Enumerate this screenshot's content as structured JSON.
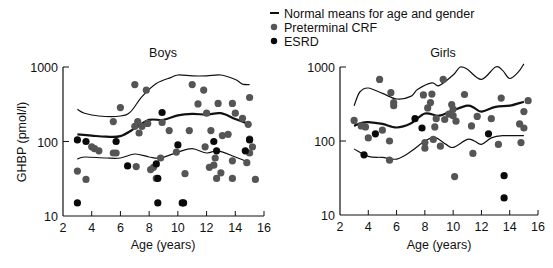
{
  "legend": {
    "items": [
      {
        "label": "Normal means for age and gender",
        "marker": "line"
      },
      {
        "label": "Preterminal CRF",
        "marker": "dot",
        "color": "#555555"
      },
      {
        "label": "ESRD",
        "marker": "dot",
        "color": "#0a0a0a"
      }
    ]
  },
  "chart_data": [
    {
      "type": "scatter",
      "title": "Boys",
      "xlabel": "Age (years)",
      "ylabel": "GHBP (pmol/l)",
      "xlim": [
        2,
        16
      ],
      "ylim": [
        10,
        1000
      ],
      "yscale": "log",
      "xticks": [
        2,
        4,
        6,
        8,
        10,
        12,
        14,
        16
      ],
      "yticks": [
        10,
        100,
        1000
      ],
      "grid": false,
      "series": [
        {
          "name": "Normal mean",
          "kind": "line",
          "width": 2.2,
          "points": [
            [
              3,
              125
            ],
            [
              4,
              120
            ],
            [
              5,
              116
            ],
            [
              6,
              118
            ],
            [
              7,
              150
            ],
            [
              8,
              195
            ],
            [
              9,
              195
            ],
            [
              10,
              225
            ],
            [
              11,
              235
            ],
            [
              12,
              230
            ],
            [
              13,
              240
            ],
            [
              14,
              200
            ],
            [
              15,
              170
            ]
          ]
        },
        {
          "name": "Upper normal",
          "kind": "line",
          "width": 1.2,
          "points": [
            [
              3,
              270
            ],
            [
              3.5,
              240
            ],
            [
              4.5,
              220
            ],
            [
              6,
              220
            ],
            [
              6.7,
              250
            ],
            [
              7.5,
              400
            ],
            [
              8.5,
              600
            ],
            [
              9.5,
              720
            ],
            [
              10,
              780
            ],
            [
              11,
              760
            ],
            [
              12,
              760
            ],
            [
              13,
              780
            ],
            [
              14,
              680
            ],
            [
              14.5,
              590
            ],
            [
              15,
              580
            ]
          ]
        },
        {
          "name": "Lower normal",
          "kind": "line",
          "width": 1.2,
          "points": [
            [
              3,
              58
            ],
            [
              3.5,
              62
            ],
            [
              5,
              60
            ],
            [
              6,
              60
            ],
            [
              7,
              68
            ],
            [
              8,
              62
            ],
            [
              8.8,
              60
            ],
            [
              10,
              72
            ],
            [
              11,
              80
            ],
            [
              12,
              70
            ],
            [
              12.8,
              75
            ],
            [
              14,
              62
            ],
            [
              15,
              52
            ]
          ]
        },
        {
          "name": "Preterminal CRF",
          "kind": "dots",
          "color": "#555555",
          "points": [
            [
              3,
              40
            ],
            [
              3.6,
              31
            ],
            [
              4,
              85
            ],
            [
              4.2,
              80
            ],
            [
              4.5,
              75
            ],
            [
              5.5,
              185
            ],
            [
              5.5,
              70
            ],
            [
              5.7,
              70
            ],
            [
              6,
              285
            ],
            [
              7,
              580
            ],
            [
              7,
              160
            ],
            [
              7.1,
              46
            ],
            [
              7.2,
              185
            ],
            [
              7.3,
              130
            ],
            [
              7.5,
              160
            ],
            [
              7.8,
              490
            ],
            [
              7.9,
              175
            ],
            [
              8.1,
              42
            ],
            [
              8.3,
              45
            ],
            [
              8.5,
              32
            ],
            [
              8.8,
              60
            ],
            [
              8.9,
              180
            ],
            [
              9.4,
              140
            ],
            [
              9.9,
              72
            ],
            [
              10.5,
              37
            ],
            [
              10.8,
              140
            ],
            [
              11,
              580
            ],
            [
              11.4,
              320
            ],
            [
              11.8,
              490
            ],
            [
              11.9,
              85
            ],
            [
              12,
              240
            ],
            [
              12.2,
              45
            ],
            [
              12.3,
              140
            ],
            [
              12.5,
              48
            ],
            [
              12.6,
              60
            ],
            [
              12.7,
              32
            ],
            [
              12.8,
              325
            ],
            [
              13,
              38
            ],
            [
              13.1,
              120
            ],
            [
              13.5,
              125
            ],
            [
              13.8,
              325
            ],
            [
              13.8,
              32
            ],
            [
              13.8,
              55
            ],
            [
              14,
              240
            ],
            [
              14.5,
              205
            ],
            [
              14.8,
              52
            ],
            [
              14.9,
              170
            ],
            [
              15,
              390
            ],
            [
              15,
              108
            ],
            [
              15,
              70
            ],
            [
              15.2,
              85
            ],
            [
              15.4,
              31
            ]
          ]
        },
        {
          "name": "ESRD",
          "kind": "dots",
          "color": "#0a0a0a",
          "points": [
            [
              3,
              105
            ],
            [
              3,
              15
            ],
            [
              3.6,
              100
            ],
            [
              5.7,
              100
            ],
            [
              6.5,
              47
            ],
            [
              8.5,
              50
            ],
            [
              8.6,
              32
            ],
            [
              8.6,
              15
            ],
            [
              8.9,
              245
            ],
            [
              10,
              90
            ],
            [
              10.3,
              15
            ],
            [
              10.4,
              15
            ],
            [
              12.5,
              100
            ],
            [
              12.7,
              75
            ],
            [
              14.7,
              75
            ],
            [
              15,
              105
            ]
          ]
        }
      ]
    },
    {
      "type": "scatter",
      "title": "Girls",
      "xlabel": "Age (years)",
      "ylabel": "",
      "xlim": [
        2,
        16
      ],
      "ylim": [
        10,
        1000
      ],
      "yscale": "log",
      "xticks": [
        2,
        4,
        6,
        8,
        10,
        12,
        14,
        16
      ],
      "yticks": [
        10,
        100,
        1000
      ],
      "grid": false,
      "series": [
        {
          "name": "Normal mean",
          "kind": "line",
          "width": 2.2,
          "points": [
            [
              3,
              160
            ],
            [
              3.5,
              175
            ],
            [
              4,
              180
            ],
            [
              5,
              170
            ],
            [
              6,
              152
            ],
            [
              7,
              172
            ],
            [
              8,
              235
            ],
            [
              9,
              220
            ],
            [
              10,
              260
            ],
            [
              11,
              300
            ],
            [
              11.5,
              280
            ],
            [
              12,
              250
            ],
            [
              13,
              290
            ],
            [
              14,
              300
            ],
            [
              15,
              340
            ]
          ]
        },
        {
          "name": "Upper normal",
          "kind": "line",
          "width": 1.2,
          "points": [
            [
              3,
              300
            ],
            [
              3.4,
              460
            ],
            [
              4,
              520
            ],
            [
              5,
              440
            ],
            [
              6,
              370
            ],
            [
              7,
              400
            ],
            [
              7.5,
              500
            ],
            [
              8.5,
              610
            ],
            [
              9,
              560
            ],
            [
              10,
              780
            ],
            [
              10.5,
              1000
            ],
            [
              11,
              930
            ],
            [
              12,
              680
            ],
            [
              13,
              1000
            ],
            [
              13.5,
              900
            ],
            [
              14,
              700
            ],
            [
              14.6,
              850
            ],
            [
              15,
              1100
            ]
          ]
        },
        {
          "name": "Lower normal",
          "kind": "line",
          "width": 1.2,
          "points": [
            [
              3,
              78
            ],
            [
              4,
              62
            ],
            [
              5,
              60
            ],
            [
              6,
              57
            ],
            [
              7,
              72
            ],
            [
              8,
              100
            ],
            [
              8.7,
              112
            ],
            [
              9.5,
              90
            ],
            [
              10,
              82
            ],
            [
              11,
              105
            ],
            [
              11.5,
              100
            ],
            [
              12,
              90
            ],
            [
              12.7,
              110
            ],
            [
              13.5,
              118
            ],
            [
              15,
              118
            ]
          ]
        },
        {
          "name": "Preterminal CRF",
          "kind": "dots",
          "color": "#555555",
          "points": [
            [
              3,
              190
            ],
            [
              3.5,
              160
            ],
            [
              3.8,
              155
            ],
            [
              4,
              110
            ],
            [
              4.8,
              680
            ],
            [
              5,
              140
            ],
            [
              5.5,
              100
            ],
            [
              5.6,
              450
            ],
            [
              5.8,
              330
            ],
            [
              5.8,
              300
            ],
            [
              5.5,
              55
            ],
            [
              7.9,
              420
            ],
            [
              8,
              95
            ],
            [
              8,
              80
            ],
            [
              8.2,
              280
            ],
            [
              8.4,
              330
            ],
            [
              8.5,
              430
            ],
            [
              8.6,
              105
            ],
            [
              8.7,
              155
            ],
            [
              8.8,
              200
            ],
            [
              9.1,
              85
            ],
            [
              9.3,
              680
            ],
            [
              9.4,
              195
            ],
            [
              9.7,
              230
            ],
            [
              9.9,
              310
            ],
            [
              10,
              270
            ],
            [
              10,
              220
            ],
            [
              10.1,
              33
            ],
            [
              10.2,
              185
            ],
            [
              10.8,
              425
            ],
            [
              11.3,
              160
            ],
            [
              11.4,
              68
            ],
            [
              11.7,
              215
            ],
            [
              12.7,
              200
            ],
            [
              13.2,
              90
            ],
            [
              13.4,
              380
            ],
            [
              14.7,
              170
            ],
            [
              14.8,
              95
            ],
            [
              15,
              250
            ],
            [
              15,
              150
            ],
            [
              15.3,
              350
            ]
          ]
        },
        {
          "name": "ESRD",
          "kind": "dots",
          "color": "#0a0a0a",
          "points": [
            [
              3.7,
              65
            ],
            [
              4.5,
              125
            ],
            [
              7.3,
              200
            ],
            [
              7.8,
              150
            ],
            [
              12.5,
              125
            ],
            [
              13.6,
              34
            ],
            [
              13.6,
              17
            ]
          ]
        }
      ]
    }
  ]
}
